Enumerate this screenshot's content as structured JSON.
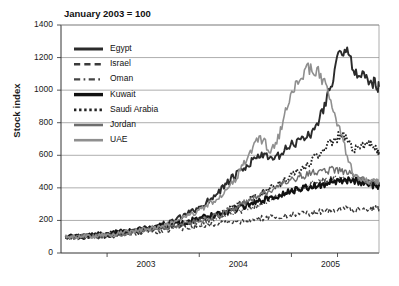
{
  "chart_data": {
    "type": "line",
    "title": "January 2003 = 100",
    "xlabel": "",
    "ylabel": "Stock index",
    "ylim": [
      0,
      1400
    ],
    "ytick_values": [
      0,
      200,
      400,
      600,
      800,
      1000,
      1200,
      1400
    ],
    "ytick_labels": [
      "0",
      "200",
      "400",
      "600",
      "800",
      "1000",
      "1200",
      "1400"
    ],
    "xlim": [
      2002.5,
      2005.95
    ],
    "xtick_values": [
      2003,
      2004,
      2005
    ],
    "xtick_labels": [
      "2003",
      "2004",
      "2005"
    ],
    "grid": "horizontal",
    "legend_position": "upper-left-inside",
    "series": [
      {
        "name": "Egypt",
        "style": "solid",
        "color": "#2b2b2b",
        "width": 1.9,
        "x": [
          2002.55,
          2002.7,
          2002.85,
          2003.0,
          2003.15,
          2003.3,
          2003.45,
          2003.6,
          2003.75,
          2003.9,
          2004.05,
          2004.2,
          2004.35,
          2004.5,
          2004.65,
          2004.8,
          2004.95,
          2005.1,
          2005.25,
          2005.4,
          2005.55,
          2005.7,
          2005.85,
          2005.95
        ],
        "values": [
          100,
          98,
          103,
          108,
          118,
          133,
          152,
          176,
          205,
          248,
          300,
          372,
          455,
          520,
          600,
          575,
          640,
          700,
          760,
          980,
          1240,
          1120,
          1060,
          1020
        ]
      },
      {
        "name": "Israel",
        "style": "dashed",
        "color": "#3a3a3a",
        "width": 1.4,
        "x": [
          2002.55,
          2002.7,
          2002.85,
          2003.0,
          2003.15,
          2003.3,
          2003.45,
          2003.6,
          2003.75,
          2003.9,
          2004.05,
          2004.2,
          2004.35,
          2004.5,
          2004.65,
          2004.8,
          2004.95,
          2005.1,
          2005.25,
          2005.4,
          2005.55,
          2005.7,
          2005.85,
          2005.95
        ],
        "values": [
          100,
          96,
          99,
          105,
          112,
          120,
          128,
          138,
          148,
          158,
          168,
          178,
          188,
          198,
          212,
          222,
          228,
          238,
          248,
          262,
          272,
          268,
          276,
          270
        ]
      },
      {
        "name": "Oman",
        "style": "dashdot",
        "color": "#444444",
        "width": 1.4,
        "x": [
          2002.55,
          2002.7,
          2002.85,
          2003.0,
          2003.15,
          2003.3,
          2003.45,
          2003.6,
          2003.75,
          2003.9,
          2004.05,
          2004.2,
          2004.35,
          2004.5,
          2004.65,
          2004.8,
          2004.95,
          2005.1,
          2005.25,
          2005.4,
          2005.55,
          2005.7,
          2005.85,
          2005.95
        ],
        "values": [
          100,
          102,
          106,
          112,
          122,
          134,
          146,
          158,
          170,
          182,
          196,
          214,
          240,
          268,
          300,
          330,
          368,
          400,
          430,
          448,
          460,
          448,
          432,
          418
        ]
      },
      {
        "name": "Kuwait",
        "style": "solid",
        "color": "#111111",
        "width": 2.2,
        "x": [
          2002.55,
          2002.7,
          2002.85,
          2003.0,
          2003.15,
          2003.3,
          2003.45,
          2003.6,
          2003.75,
          2003.9,
          2004.05,
          2004.2,
          2004.35,
          2004.5,
          2004.65,
          2004.8,
          2004.95,
          2005.1,
          2005.25,
          2005.4,
          2005.55,
          2005.7,
          2005.85,
          2005.95
        ],
        "values": [
          100,
          104,
          110,
          118,
          128,
          140,
          152,
          168,
          182,
          198,
          218,
          240,
          262,
          290,
          318,
          342,
          368,
          392,
          412,
          432,
          448,
          442,
          420,
          408
        ]
      },
      {
        "name": "Saudi Arabia",
        "style": "dotted",
        "color": "#222222",
        "width": 1.9,
        "x": [
          2002.55,
          2002.7,
          2002.85,
          2003.0,
          2003.15,
          2003.3,
          2003.45,
          2003.6,
          2003.75,
          2003.9,
          2004.05,
          2004.2,
          2004.35,
          2004.5,
          2004.65,
          2004.8,
          2004.95,
          2005.1,
          2005.25,
          2005.4,
          2005.55,
          2005.7,
          2005.85,
          2005.95
        ],
        "values": [
          100,
          103,
          108,
          115,
          125,
          136,
          148,
          160,
          176,
          192,
          212,
          240,
          276,
          318,
          362,
          400,
          452,
          512,
          580,
          660,
          720,
          640,
          680,
          620
        ]
      },
      {
        "name": "Jordan",
        "style": "solid",
        "color": "#6e6e6e",
        "width": 1.4,
        "x": [
          2002.55,
          2002.7,
          2002.85,
          2003.0,
          2003.15,
          2003.3,
          2003.45,
          2003.6,
          2003.75,
          2003.9,
          2004.05,
          2004.2,
          2004.35,
          2004.5,
          2004.65,
          2004.8,
          2004.95,
          2005.1,
          2005.25,
          2005.4,
          2005.55,
          2005.7,
          2005.85,
          2005.95
        ],
        "values": [
          100,
          101,
          105,
          110,
          118,
          128,
          140,
          152,
          168,
          186,
          206,
          232,
          268,
          310,
          352,
          392,
          432,
          468,
          492,
          508,
          500,
          470,
          440,
          420
        ]
      },
      {
        "name": "UAE",
        "style": "solid",
        "color": "#8f8f8f",
        "width": 1.6,
        "x": [
          2002.55,
          2002.7,
          2002.85,
          2003.0,
          2003.15,
          2003.3,
          2003.45,
          2003.6,
          2003.75,
          2003.9,
          2004.05,
          2004.2,
          2004.35,
          2004.5,
          2004.65,
          2004.8,
          2004.95,
          2005.1,
          2005.25,
          2005.4,
          2005.55,
          2005.7,
          2005.85,
          2005.95
        ],
        "values": [
          100,
          100,
          104,
          110,
          120,
          134,
          150,
          170,
          196,
          232,
          280,
          340,
          420,
          560,
          700,
          640,
          880,
          1080,
          1130,
          980,
          700,
          470,
          440,
          430
        ]
      }
    ],
    "legend_entries": [
      {
        "label": "Egypt",
        "style": "solid",
        "color": "#2b2b2b",
        "width": 3.0
      },
      {
        "label": "Israel",
        "style": "dashed",
        "color": "#3a3a3a",
        "width": 2.4
      },
      {
        "label": "Oman",
        "style": "dashdot",
        "color": "#444444",
        "width": 2.4
      },
      {
        "label": "Kuwait",
        "style": "solid",
        "color": "#111111",
        "width": 3.4
      },
      {
        "label": "Saudi Arabia",
        "style": "dotted",
        "color": "#222222",
        "width": 2.8
      },
      {
        "label": "Jordan",
        "style": "solid",
        "color": "#6e6e6e",
        "width": 2.6
      },
      {
        "label": "UAE",
        "style": "solid",
        "color": "#8f8f8f",
        "width": 2.6
      }
    ]
  }
}
